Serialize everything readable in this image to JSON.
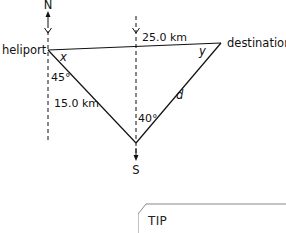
{
  "diagram": {
    "type": "bearing-triangle",
    "compass": {
      "north_label": "N",
      "south_label": "S"
    },
    "points": {
      "heliport": {
        "label": "heliport"
      },
      "destination": {
        "label": "destination"
      }
    },
    "sides": {
      "heliport_to_destination": "25.0 km",
      "heliport_to_south_vertex": "15.0 km",
      "south_vertex_to_destination": "d"
    },
    "angles": {
      "at_heliport_from_south": "45°",
      "at_south_vertex": "40°",
      "at_heliport_interior": "x",
      "at_destination_interior": "y"
    },
    "colors": {
      "lines": "#111111",
      "background": "#ffffff",
      "tip_border": "#888888"
    }
  },
  "tip": {
    "label": "TIP"
  }
}
